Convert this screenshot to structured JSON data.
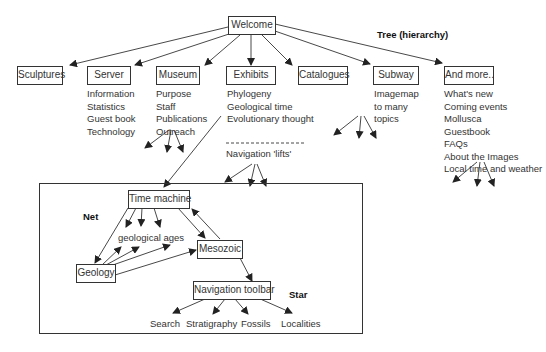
{
  "header_partial": "…, showing the top-level structure",
  "labels": {
    "tree": "Tree (hierarchy)",
    "net": "Net",
    "star": "Star",
    "nav_lifts": "Navigation 'lifts'",
    "geological_ages": "geological ages"
  },
  "root": "Welcome",
  "top_nodes": [
    {
      "label": "Sculptures",
      "items": []
    },
    {
      "label": "Server",
      "items": [
        "Information",
        "Statistics",
        "Guest book",
        "Technology"
      ]
    },
    {
      "label": "Museum",
      "items": [
        "Purpose",
        "Staff",
        "Publications",
        "Outreach"
      ]
    },
    {
      "label": "Exhibits",
      "items": [
        "Phylogeny",
        "Geological time",
        "Evolutionary thought"
      ]
    },
    {
      "label": "Catalogues",
      "items": []
    },
    {
      "label": "Subway",
      "items": [
        "Imagemap",
        "to many",
        "topics"
      ]
    },
    {
      "label": "And more..",
      "items": [
        "What's new",
        "Coming events",
        "Mollusca",
        "Guestbook",
        "FAQs",
        "About the Images",
        "Local time and weather"
      ]
    }
  ],
  "inner": {
    "time_machine": "Time machine",
    "geology": "Geology",
    "mesozoic": "Mesozoic",
    "nav_toolbar": "Navigation toolbar",
    "toolbar_items": [
      "Search",
      "Stratigraphy",
      "Fossils",
      "Localities"
    ]
  }
}
